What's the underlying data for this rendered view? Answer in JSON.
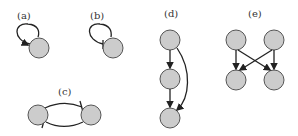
{
  "diagram": {
    "panels": [
      {
        "id": "a",
        "label": "(a)",
        "description": "self-activation loop"
      },
      {
        "id": "b",
        "label": "(b)",
        "description": "self-inhibition loop"
      },
      {
        "id": "c",
        "label": "(c)",
        "description": "mutual inhibition between two nodes"
      },
      {
        "id": "d",
        "label": "(d)",
        "description": "feed-forward loop: chain of three nodes with direct top-to-bottom arrow"
      },
      {
        "id": "e",
        "label": "(e)",
        "description": "two top nodes each activating both bottom nodes (crossing arrows)"
      }
    ],
    "colors": {
      "node_fill": "#cccccc",
      "node_stroke": "#555555",
      "edge": "#222222"
    }
  }
}
